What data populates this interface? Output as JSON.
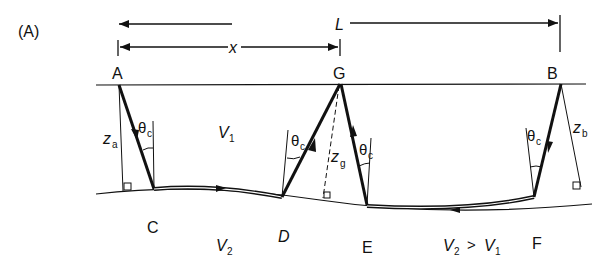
{
  "panel_label": "(A)",
  "dimensions": {
    "L_label": "L",
    "x_label": "x"
  },
  "points": {
    "A": "A",
    "B": "B",
    "G": "G",
    "C": "C",
    "D": "D",
    "E": "E",
    "F": "F"
  },
  "depths": {
    "za_main": "z",
    "za_sub": "a",
    "zb_main": "z",
    "zb_sub": "b",
    "zg_main": "z",
    "zg_sub": "g"
  },
  "angles": {
    "theta_main": "θ",
    "theta_sub": "c"
  },
  "layers": {
    "v1_main": "V",
    "v1_sub": "1",
    "v2_main": "V",
    "v2_sub": "2",
    "relation_left_main": "V",
    "relation_left_sub": "2",
    "relation_op": ">",
    "relation_right_main": "V",
    "relation_right_sub": "1"
  },
  "colors": {
    "ink": "#111111",
    "background": "#ffffff"
  }
}
